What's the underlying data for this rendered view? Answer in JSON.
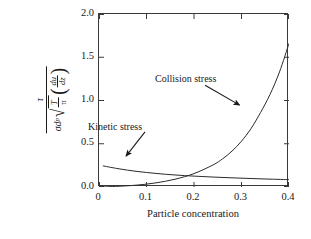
{
  "chart_data": {
    "type": "line",
    "title": "",
    "subtitle": "",
    "xlabel": "Particle concentration",
    "ylabel_text": "tau / ( sigma d_p sqrt(T/pi) (du/dz) )",
    "ylabel_parts": {
      "numerator": "τ",
      "den_sigma": "σ",
      "den_d": "d",
      "den_d_sub": "p",
      "den_sqrt_num": "T",
      "den_sqrt_den": "π",
      "den_paren_open": "(",
      "den_paren_close": ")",
      "den_deriv_num": "du",
      "den_deriv_den": "dz"
    },
    "xlim": [
      0,
      0.4
    ],
    "ylim": [
      0,
      2.0
    ],
    "xticks": [
      0,
      0.1,
      0.2,
      0.3,
      0.4
    ],
    "xtick_labels": [
      "0",
      "0.1",
      "0.2",
      "0.3",
      "0.4"
    ],
    "yticks": [
      0.0,
      0.5,
      1.0,
      1.5,
      2.0
    ],
    "ytick_labels": [
      "0.0",
      "0.5",
      "1.0",
      "1.5",
      "2.0"
    ],
    "grid": false,
    "legend": "none",
    "frame": "box",
    "tick_direction": "in",
    "line_color": "#2b2b2b",
    "frame_color": "#3a3a3a",
    "series": [
      {
        "name": "Kinetic stress",
        "label_position": "upper-left",
        "x": [
          0.008,
          0.02,
          0.04,
          0.06,
          0.08,
          0.1,
          0.12,
          0.14,
          0.16,
          0.18,
          0.2,
          0.24,
          0.28,
          0.32,
          0.36,
          0.4
        ],
        "values": [
          0.245,
          0.232,
          0.212,
          0.195,
          0.18,
          0.168,
          0.157,
          0.147,
          0.139,
          0.132,
          0.126,
          0.115,
          0.106,
          0.098,
          0.091,
          0.085
        ]
      },
      {
        "name": "Collision stress",
        "label_position": "upper-middle",
        "x": [
          0.0,
          0.04,
          0.08,
          0.12,
          0.16,
          0.2,
          0.24,
          0.26,
          0.28,
          0.3,
          0.32,
          0.34,
          0.36,
          0.38,
          0.4
        ],
        "values": [
          0.0,
          0.008,
          0.022,
          0.048,
          0.09,
          0.155,
          0.255,
          0.325,
          0.415,
          0.53,
          0.675,
          0.86,
          1.07,
          1.33,
          1.66
        ]
      }
    ],
    "annotations": [
      {
        "name": "Collision stress",
        "text": "Collision stress",
        "arrow_from": [
          0.2255,
          1.165
        ],
        "arrow_to": [
          0.298,
          0.935
        ]
      },
      {
        "name": "Kinetic stress",
        "text": "Kinetic stress",
        "arrow_from": [
          0.099,
          0.625
        ],
        "arrow_to": [
          0.059,
          0.345
        ]
      }
    ]
  }
}
